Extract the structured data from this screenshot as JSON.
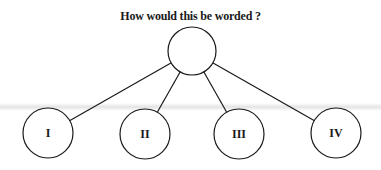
{
  "title": "How would this be worded ?",
  "diagram": {
    "type": "tree",
    "root": {
      "label": "",
      "cx": 192,
      "cy": 51,
      "r": 24
    },
    "children": [
      {
        "label": "I",
        "cx": 48,
        "cy": 133,
        "r": 25
      },
      {
        "label": "II",
        "cx": 145,
        "cy": 134,
        "r": 25
      },
      {
        "label": "III",
        "cx": 239,
        "cy": 134,
        "r": 25
      },
      {
        "label": "IV",
        "cx": 336,
        "cy": 133,
        "r": 25
      }
    ],
    "stroke_color": "#1a1a1a",
    "fill_color": "#ffffff"
  }
}
